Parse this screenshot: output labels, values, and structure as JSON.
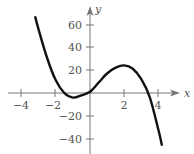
{
  "chart_data": {
    "type": "line",
    "title": "",
    "xlabel": "x",
    "ylabel": "y",
    "xlim": [
      -4.2,
      4.9
    ],
    "ylim": [
      -52,
      80
    ],
    "grid": false,
    "x_ticks": [
      -4,
      -2,
      2,
      4
    ],
    "x_tick_labels": [
      "−4",
      "−2",
      "2",
      "4"
    ],
    "y_ticks": [
      60,
      40,
      20,
      -20,
      -40
    ],
    "y_tick_labels": [
      "60",
      "40",
      "20",
      "−20",
      "−40"
    ],
    "series": [
      {
        "name": "f(x)",
        "color": "#111111",
        "x": [
          -3.2,
          -3.0,
          -2.5,
          -2.0,
          -1.5,
          -1.0,
          -0.5,
          0.0,
          0.5,
          1.0,
          1.5,
          2.0,
          2.5,
          3.0,
          3.5,
          4.0,
          4.2
        ],
        "y": [
          66,
          55,
          30,
          11,
          0,
          -4,
          -2,
          1,
          9,
          17,
          22,
          24,
          21,
          12,
          -4,
          -32,
          -45
        ]
      }
    ],
    "annotations": [
      {
        "text": "local minimum near (-1, -4)"
      },
      {
        "text": "local maximum near (2, 24)"
      }
    ]
  },
  "axes": {
    "x_label": "x",
    "y_label": "y",
    "x_ticks": [
      {
        "label": "−4"
      },
      {
        "label": "−2"
      },
      {
        "label": "2"
      },
      {
        "label": "4"
      }
    ],
    "y_ticks": [
      {
        "label": "60"
      },
      {
        "label": "40"
      },
      {
        "label": "20"
      },
      {
        "label": "−20"
      },
      {
        "label": "−40"
      }
    ]
  }
}
